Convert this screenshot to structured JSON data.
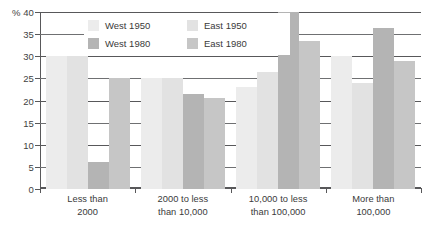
{
  "chart_data": {
    "type": "bar",
    "title": "",
    "xlabel": "",
    "ylabel": "%",
    "ylim": [
      0,
      40
    ],
    "yticks": [
      0,
      5,
      10,
      15,
      20,
      25,
      30,
      35,
      40
    ],
    "ytick_labels": [
      "0",
      "5",
      "10",
      "15",
      "20",
      "25",
      "30",
      "35",
      "% 40"
    ],
    "grid": true,
    "legend_position": "top-center",
    "categories": [
      "Less than 2000",
      "2000 to less than 10,000",
      "10,000 to less than 100,000",
      "More than 100,000"
    ],
    "category_lines": [
      [
        "Less than",
        "2000"
      ],
      [
        "2000 to less",
        "than 10,000"
      ],
      [
        "10,000 to less",
        "than 100,000"
      ],
      [
        "More than",
        "100,000"
      ]
    ],
    "series": [
      {
        "name": "West 1950",
        "color": "#ececec",
        "values": [
          30,
          25,
          23,
          30
        ]
      },
      {
        "name": "East 1950",
        "color": "#e2e2e2",
        "values": [
          30,
          25,
          26.5,
          24
        ]
      },
      {
        "name": "West 1980",
        "color": "#b4b4b4",
        "values": [
          6,
          21.5,
          40,
          36.5
        ]
      },
      {
        "name": "East 1980",
        "color": "#c6c6c6",
        "values": [
          25,
          20.5,
          33.5,
          29
        ]
      }
    ]
  }
}
